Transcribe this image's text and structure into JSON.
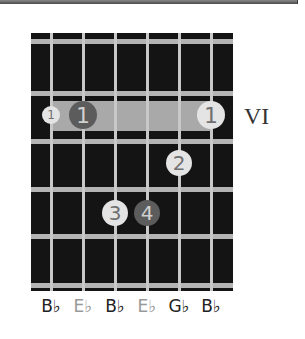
{
  "diagram": {
    "type": "guitar-chord-chart",
    "position_label": "VI",
    "strings": 6,
    "frets_shown": 4,
    "barre": {
      "fret": 1,
      "from_string": 1,
      "to_string": 6
    },
    "fingers": [
      {
        "label": "1",
        "string": 1,
        "fret": 1,
        "style": "white",
        "size": "small"
      },
      {
        "label": "1",
        "string": 2,
        "fret": 1,
        "style": "dark",
        "size": "large"
      },
      {
        "label": "1",
        "string": 6,
        "fret": 1,
        "style": "white",
        "size": "large"
      },
      {
        "label": "2",
        "string": 5,
        "fret": 2,
        "style": "white",
        "size": "large"
      },
      {
        "label": "3",
        "string": 3,
        "fret": 3,
        "style": "white",
        "size": "large"
      },
      {
        "label": "4",
        "string": 4,
        "fret": 3,
        "style": "dark",
        "size": "large"
      }
    ],
    "notes": [
      {
        "label": "B♭",
        "color": "#222222"
      },
      {
        "label": "E♭",
        "color": "#999999"
      },
      {
        "label": "B♭",
        "color": "#222222"
      },
      {
        "label": "E♭",
        "color": "#999999"
      },
      {
        "label": "G♭",
        "color": "#222222"
      },
      {
        "label": "B♭",
        "color": "#222222"
      }
    ]
  }
}
